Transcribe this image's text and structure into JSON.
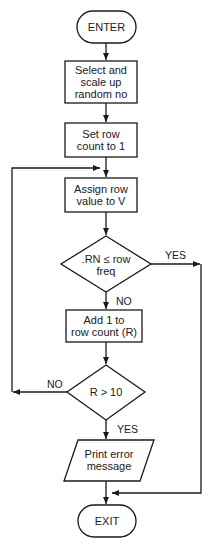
{
  "flowchart": {
    "nodes": [
      {
        "id": "enter",
        "type": "terminal",
        "label": "ENTER"
      },
      {
        "id": "select",
        "type": "process",
        "label": "Select and scale up random no",
        "lines": [
          "Select and",
          "scale up",
          "random no"
        ]
      },
      {
        "id": "setrow",
        "type": "process",
        "label": "Set row count to 1",
        "lines": [
          "Set row",
          "count to 1"
        ]
      },
      {
        "id": "assign",
        "type": "process",
        "label": "Assign row value to V",
        "lines": [
          "Assign row",
          "value to V"
        ]
      },
      {
        "id": "cond1",
        "type": "decision",
        "label": ".RN ≤ row freq",
        "lines": [
          ".RN ≤ row",
          "freq"
        ]
      },
      {
        "id": "addone",
        "type": "process",
        "label": "Add 1 to row count (R)",
        "lines": [
          "Add 1 to",
          "row count (R)"
        ]
      },
      {
        "id": "cond2",
        "type": "decision",
        "label": "R > 10",
        "lines": [
          "R > 10"
        ]
      },
      {
        "id": "print",
        "type": "io",
        "label": "Print error message",
        "lines": [
          "Print error",
          "message"
        ]
      },
      {
        "id": "exit",
        "type": "terminal",
        "label": "EXIT"
      }
    ],
    "edges": [
      {
        "from": "enter",
        "to": "select",
        "label": ""
      },
      {
        "from": "select",
        "to": "setrow",
        "label": ""
      },
      {
        "from": "setrow",
        "to": "assign",
        "label": ""
      },
      {
        "from": "assign",
        "to": "cond1",
        "label": ""
      },
      {
        "from": "cond1",
        "to": "exit",
        "label": "YES"
      },
      {
        "from": "cond1",
        "to": "addone",
        "label": "NO"
      },
      {
        "from": "addone",
        "to": "cond2",
        "label": ""
      },
      {
        "from": "cond2",
        "to": "assign",
        "label": "NO"
      },
      {
        "from": "cond2",
        "to": "print",
        "label": "YES"
      },
      {
        "from": "print",
        "to": "exit",
        "label": ""
      }
    ],
    "edge_labels": {
      "cond1_yes": "YES",
      "cond1_no": "NO",
      "cond2_no": "NO",
      "cond2_yes": "YES"
    }
  }
}
